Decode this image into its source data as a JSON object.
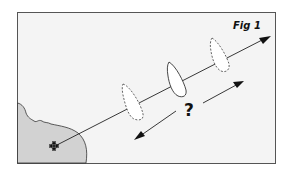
{
  "figure": {
    "label": "Fig 1",
    "question_mark": "?",
    "colors": {
      "background": "#f4f4f4",
      "frame": "#555555",
      "land": "#d2d2d2",
      "line": "#222222",
      "boat_fill": "#ffffff"
    }
  },
  "elements": {
    "land": "coastline",
    "origin_marker": "charted-position-icon",
    "bearing_line": "line-of-position",
    "boats": [
      {
        "id": "boat-possible-near",
        "style": "dashed"
      },
      {
        "id": "boat-actual",
        "style": "solid"
      },
      {
        "id": "boat-possible-far",
        "style": "dashed"
      }
    ],
    "range_arrows": [
      "arrow-toward-shore",
      "arrow-away-from-shore"
    ]
  }
}
